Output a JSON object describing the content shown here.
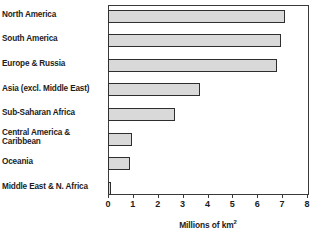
{
  "chart_data": {
    "type": "bar",
    "orientation": "horizontal",
    "title": "",
    "xlabel": "Millions of km²",
    "ylabel": "",
    "xlim": [
      0,
      8
    ],
    "xticks": [
      "0",
      "1",
      "2",
      "3",
      "4",
      "5",
      "6",
      "7",
      "8"
    ],
    "grid": false,
    "legend": null,
    "categories": [
      "North America",
      "South America",
      "Europe & Russia",
      "Asia (excl. Middle East)",
      "Sub-Saharan Africa",
      "Central America & Caribbean",
      "Oceania",
      "Middle East & N. Africa"
    ],
    "values": [
      7.1,
      6.95,
      6.8,
      3.7,
      2.7,
      0.95,
      0.87,
      0.1
    ],
    "bar_fill_color": "#d9d9d9",
    "bar_border_color": "#2e2e2e",
    "axis_color": "#3a3a3a",
    "text_color": "#1d1d1d"
  },
  "axis_title_parts": {
    "main": "Millions of km",
    "superscript": "2"
  },
  "category_label_lines": [
    [
      "North America"
    ],
    [
      "South America"
    ],
    [
      "Europe & Russia"
    ],
    [
      "Asia (excl. Middle East)"
    ],
    [
      "Sub-Saharan Africa"
    ],
    [
      "Central America &",
      "Caribbean"
    ],
    [
      "Oceania"
    ],
    [
      "Middle East & N. Africa"
    ]
  ]
}
